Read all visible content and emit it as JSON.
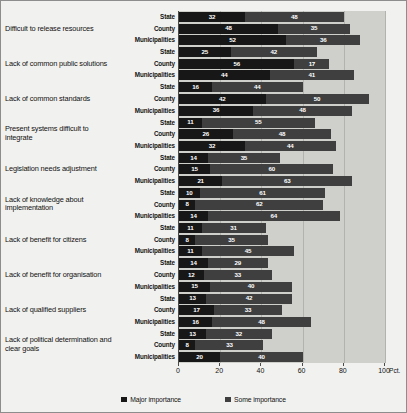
{
  "chart_data": {
    "type": "bar",
    "orientation": "horizontal",
    "stacked": true,
    "title": "",
    "xlabel": "Pct.",
    "ylabel": "",
    "xlim": [
      0,
      100
    ],
    "xticks": [
      0,
      20,
      40,
      60,
      80,
      100
    ],
    "grid": true,
    "legend_position": "bottom",
    "series": [
      {
        "name": "Major importance",
        "color": "#171717"
      },
      {
        "name": "Some importance",
        "color": "#3f3f3f"
      }
    ],
    "subgroups": [
      "State",
      "County",
      "Municipalities"
    ],
    "categories": [
      "Difficult to release resources",
      "Lack of common public solutions",
      "Lack of common standards",
      "Present systems difficult to integrate",
      "Legislation needs adjustment",
      "Lack of knowledge about implementation",
      "Lack of benefit for citizens",
      "Lack of benefit for organisation",
      "Lack of qualified suppliers",
      "Lack of political determination and clear goals"
    ],
    "groups": [
      {
        "category": "Difficult to release resources",
        "rows": [
          {
            "subgroup": "State",
            "major": 32,
            "some": 48
          },
          {
            "subgroup": "County",
            "major": 48,
            "some": 35
          },
          {
            "subgroup": "Municipalities",
            "major": 52,
            "some": 36
          }
        ]
      },
      {
        "category": "Lack of common public solutions",
        "rows": [
          {
            "subgroup": "State",
            "major": 25,
            "some": 42
          },
          {
            "subgroup": "County",
            "major": 56,
            "some": 17
          },
          {
            "subgroup": "Municipalities",
            "major": 44,
            "some": 41
          }
        ]
      },
      {
        "category": "Lack of common standards",
        "rows": [
          {
            "subgroup": "State",
            "major": 16,
            "some": 44
          },
          {
            "subgroup": "County",
            "major": 42,
            "some": 50
          },
          {
            "subgroup": "Municipalities",
            "major": 36,
            "some": 48
          }
        ]
      },
      {
        "category": "Present systems difficult to integrate",
        "rows": [
          {
            "subgroup": "State",
            "major": 11,
            "some": 55
          },
          {
            "subgroup": "County",
            "major": 26,
            "some": 48
          },
          {
            "subgroup": "Municipalities",
            "major": 32,
            "some": 44
          }
        ]
      },
      {
        "category": "Legislation needs adjustment",
        "rows": [
          {
            "subgroup": "State",
            "major": 14,
            "some": 35
          },
          {
            "subgroup": "County",
            "major": 15,
            "some": 60
          },
          {
            "subgroup": "Municipalities",
            "major": 21,
            "some": 63
          }
        ]
      },
      {
        "category": "Lack of knowledge about implementation",
        "rows": [
          {
            "subgroup": "State",
            "major": 10,
            "some": 61
          },
          {
            "subgroup": "County",
            "major": 8,
            "some": 62
          },
          {
            "subgroup": "Municipalities",
            "major": 14,
            "some": 64
          }
        ]
      },
      {
        "category": "Lack of benefit for citizens",
        "rows": [
          {
            "subgroup": "State",
            "major": 11,
            "some": 31
          },
          {
            "subgroup": "County",
            "major": 8,
            "some": 35
          },
          {
            "subgroup": "Municipalities",
            "major": 11,
            "some": 45
          }
        ]
      },
      {
        "category": "Lack of benefit for organisation",
        "rows": [
          {
            "subgroup": "State",
            "major": 14,
            "some": 29
          },
          {
            "subgroup": "County",
            "major": 12,
            "some": 33
          },
          {
            "subgroup": "Municipalities",
            "major": 15,
            "some": 40
          }
        ]
      },
      {
        "category": "Lack of qualified suppliers",
        "rows": [
          {
            "subgroup": "State",
            "major": 13,
            "some": 42
          },
          {
            "subgroup": "County",
            "major": 17,
            "some": 33
          },
          {
            "subgroup": "Municipalities",
            "major": 16,
            "some": 48
          }
        ]
      },
      {
        "category": "Lack of political determination and clear goals",
        "rows": [
          {
            "subgroup": "State",
            "major": 13,
            "some": 32
          },
          {
            "subgroup": "County",
            "major": 8,
            "some": 33
          },
          {
            "subgroup": "Municipalities",
            "major": 20,
            "some": 40
          }
        ]
      }
    ]
  },
  "axis": {
    "unit_label": "Pct.",
    "tick_labels": [
      "0",
      "20",
      "40",
      "60",
      "80",
      "100"
    ]
  },
  "legend": {
    "items": [
      {
        "label": "Major importance"
      },
      {
        "label": "Some importance"
      }
    ]
  },
  "colors": {
    "major": "#171717",
    "some": "#3f3f3f",
    "plot_background": "#cfcfcb",
    "figure_background": "#f1f1ef",
    "gridline": "#b2b2ae",
    "axis": "#4a4a4a"
  }
}
